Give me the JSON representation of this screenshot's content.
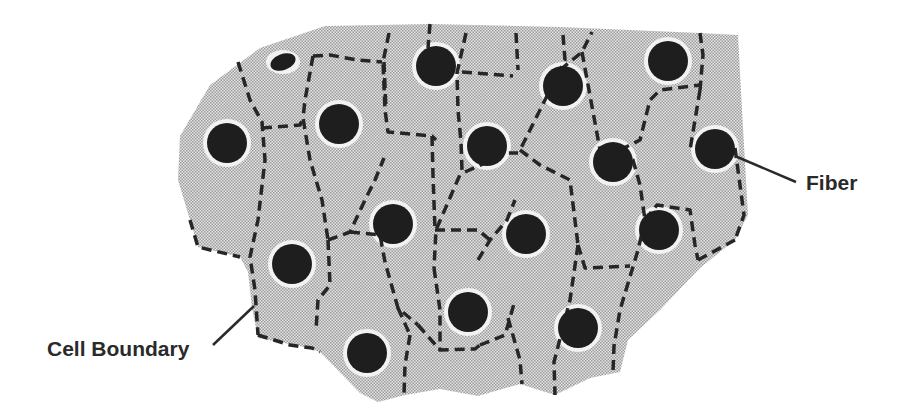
{
  "diagram": {
    "type": "cross-section",
    "colors": {
      "background": "#ffffff",
      "matrix_fill": "#d4d4d4",
      "fiber": "#1e1e1e",
      "boundary": "#262626",
      "leader_line": "#2a2a2a",
      "label_text": "#2a2a2a"
    },
    "labels": {
      "fiber": "Fiber",
      "cell_boundary": "Cell Boundary"
    },
    "fibers": [
      {
        "cx": 283,
        "cy": 62,
        "rx": 13,
        "ry": 8
      },
      {
        "cx": 436,
        "cy": 66,
        "rx": 20,
        "ry": 20
      },
      {
        "cx": 563,
        "cy": 86,
        "rx": 20,
        "ry": 20
      },
      {
        "cx": 668,
        "cy": 61,
        "rx": 20,
        "ry": 20
      },
      {
        "cx": 227,
        "cy": 143,
        "rx": 20,
        "ry": 20
      },
      {
        "cx": 339,
        "cy": 124,
        "rx": 20,
        "ry": 20
      },
      {
        "cx": 487,
        "cy": 146,
        "rx": 20,
        "ry": 20
      },
      {
        "cx": 613,
        "cy": 162,
        "rx": 20,
        "ry": 20
      },
      {
        "cx": 715,
        "cy": 149,
        "rx": 20,
        "ry": 20
      },
      {
        "cx": 393,
        "cy": 224,
        "rx": 20,
        "ry": 20
      },
      {
        "cx": 526,
        "cy": 234,
        "rx": 20,
        "ry": 20
      },
      {
        "cx": 659,
        "cy": 230,
        "rx": 20,
        "ry": 20
      },
      {
        "cx": 292,
        "cy": 264,
        "rx": 20,
        "ry": 20
      },
      {
        "cx": 468,
        "cy": 312,
        "rx": 20,
        "ry": 20
      },
      {
        "cx": 578,
        "cy": 328,
        "rx": 20,
        "ry": 20
      },
      {
        "cx": 367,
        "cy": 353,
        "rx": 20,
        "ry": 20
      }
    ],
    "outline": "M 180,136 L 210,85 L 260,48 L 325,26 L 430,24 L 560,27 L 700,33 L 738,35 L 742,110 L 748,215 L 735,240 L 700,268 L 660,310 L 628,340 L 620,372 L 590,378 L 555,395 L 520,384 L 478,396 L 440,389 L 405,395 L 378,402 L 360,393 L 320,352 L 300,346 L 258,338 L 252,308 L 248,272 L 240,257 L 198,247 L 190,220 L 178,180 Z",
    "boundaries": [
      "M 238,62 L 250,100 L 262,122 L 265,160 L 258,220 L 250,257 L 255,290 L 258,335",
      "M 262,128 L 300,125 L 303,118",
      "M 313,56 L 305,100 L 303,118 L 310,160 L 322,200 L 328,240",
      "M 313,56 L 330,55 L 357,60 L 382,62",
      "M 389,33 L 383,62 L 385,110 L 388,132 L 432,136 L 436,140",
      "M 384,62 L 386,110",
      "M 430,24 L 428,48",
      "M 466,33 L 457,73 L 458,110 L 461,142 L 462,170 L 436,230 L 434,268",
      "M 462,72 L 513,76",
      "M 465,172 L 507,153 L 518,153",
      "M 432,136 L 433,175 L 435,230",
      "M 563,35 L 565,60 L 560,70 L 540,110 L 520,150",
      "M 516,33 L 518,70",
      "M 560,70 L 582,52 L 592,32",
      "M 582,52 L 600,150",
      "M 600,150 L 620,150",
      "M 620,150 L 640,140 L 650,100 L 660,90 L 700,85",
      "M 700,33 L 703,55 L 700,90",
      "M 620,150 L 633,160 L 640,185 L 645,220",
      "M 700,90 L 695,120 L 690,150",
      "M 645,220 L 657,205 L 690,210 L 695,245 L 698,260",
      "M 735,148 L 744,215 L 735,240",
      "M 698,260 L 735,240",
      "M 645,220 L 638,250 L 620,310 L 614,346 L 613,372",
      "M 578,245 L 585,268 L 630,266",
      "M 520,150 L 540,165 L 570,180 L 578,245",
      "M 578,245 L 570,300 L 554,362 L 555,395",
      "M 478,260 L 490,240 L 507,220 L 515,200",
      "M 435,230 L 478,230 L 490,240",
      "M 434,268 L 440,310 L 440,350",
      "M 328,240 L 350,232 L 365,200 L 375,180 L 384,158",
      "M 350,232 L 380,235 L 385,262 L 398,308 L 418,325",
      "M 328,240 L 330,285 L 318,300 L 316,330",
      "M 418,325 L 440,350 L 475,349 L 480,345",
      "M 398,308 L 410,335",
      "M 410,335 L 405,365 L 404,395",
      "M 480,345 L 505,335 L 510,318 L 515,300",
      "M 508,318 L 520,360 L 522,384",
      "M 258,335 L 290,345 L 312,348 L 320,352",
      "M 190,220 L 198,247 L 240,257"
    ],
    "leaders": [
      {
        "x1": 735,
        "y1": 156,
        "x2": 796,
        "y2": 182
      },
      {
        "x1": 254,
        "y1": 306,
        "x2": 213,
        "y2": 345
      }
    ]
  }
}
